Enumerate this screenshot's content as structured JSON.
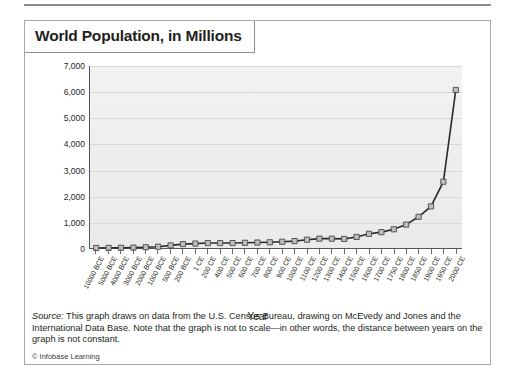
{
  "figure": {
    "title": "World Population, in Millions",
    "source_label": "Source:",
    "source_text": " This graph draws on data from the U.S. Census Bureau, drawing on McEvedy and Jones and the International Data Base. Note that the graph is not to scale—in other words, the distance between years on the graph is not constant.",
    "credit": "© Infobase Learning"
  },
  "chart_data": {
    "type": "line",
    "title": "World Population, in Millions",
    "xlabel": "Year",
    "ylabel": "",
    "ylim": [
      0,
      7000
    ],
    "ytick_labels": [
      "0",
      "1,000",
      "2,000",
      "3,000",
      "4,000",
      "5,000",
      "6,000",
      "7,000"
    ],
    "yticks": [
      0,
      1000,
      2000,
      3000,
      4000,
      5000,
      6000,
      7000
    ],
    "grid": true,
    "legend": false,
    "marker": "square",
    "categories": [
      "10000 BCE",
      "5000 BCE",
      "4000 BCE",
      "3000 BCE",
      "2000 BCE",
      "1000 BCE",
      "500 BCE",
      "200 BCE",
      "1 CE",
      "200 CE",
      "400 CE",
      "500 CE",
      "600 CE",
      "700 CE",
      "800 CE",
      "900 CE",
      "1000 CE",
      "1100 CE",
      "1200 CE",
      "1300 CE",
      "1400 CE",
      "1500 CE",
      "1600 CE",
      "1700 CE",
      "1750 CE",
      "1800 CE",
      "1850 CE",
      "1900 CE",
      "1950 CE",
      "2000 CE"
    ],
    "values": [
      1,
      5,
      7,
      14,
      27,
      50,
      100,
      150,
      170,
      190,
      190,
      190,
      200,
      210,
      220,
      240,
      265,
      320,
      360,
      360,
      350,
      425,
      545,
      610,
      720,
      900,
      1200,
      1600,
      2550,
      6080
    ],
    "axis_note": "x-axis is not to scale"
  }
}
